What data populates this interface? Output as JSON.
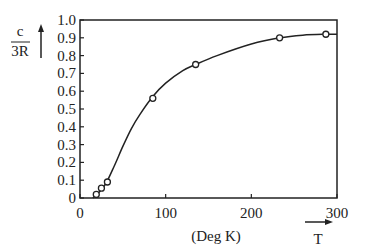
{
  "chart_data": {
    "type": "line",
    "title": "",
    "xlabel": "(Deg K)",
    "ylabel_numerator": "c",
    "ylabel_denominator": "3R",
    "x_arrow_label": "T",
    "xlim": [
      0,
      300
    ],
    "ylim": [
      0,
      1.0
    ],
    "x_ticks": [
      0,
      100,
      200,
      300
    ],
    "x_tick_labels": [
      "0",
      "100",
      "200",
      "300"
    ],
    "y_ticks": [
      0,
      0.1,
      0.2,
      0.3,
      0.4,
      0.5,
      0.6,
      0.7,
      0.8,
      0.9,
      1.0
    ],
    "y_tick_labels": [
      "0",
      "0.1",
      "0.2",
      "0.3",
      "0.4",
      "0.5",
      "0.6",
      "0.7",
      "0.8",
      "0.9",
      "1.0"
    ],
    "grid": false,
    "legend": null,
    "series": [
      {
        "name": "measured",
        "style": "open-circle markers",
        "x": [
          19,
          25,
          32,
          85,
          135,
          233,
          287
        ],
        "y": [
          0.02,
          0.055,
          0.09,
          0.56,
          0.75,
          0.9,
          0.92
        ]
      },
      {
        "name": "fit-curve",
        "style": "smooth solid line",
        "x": [
          15,
          20,
          30,
          40,
          50,
          60,
          70,
          85,
          100,
          120,
          135,
          160,
          200,
          233,
          260,
          287,
          300
        ],
        "y": [
          0.0,
          0.02,
          0.08,
          0.18,
          0.29,
          0.39,
          0.47,
          0.57,
          0.645,
          0.715,
          0.75,
          0.8,
          0.865,
          0.9,
          0.915,
          0.92,
          0.92
        ]
      }
    ]
  }
}
